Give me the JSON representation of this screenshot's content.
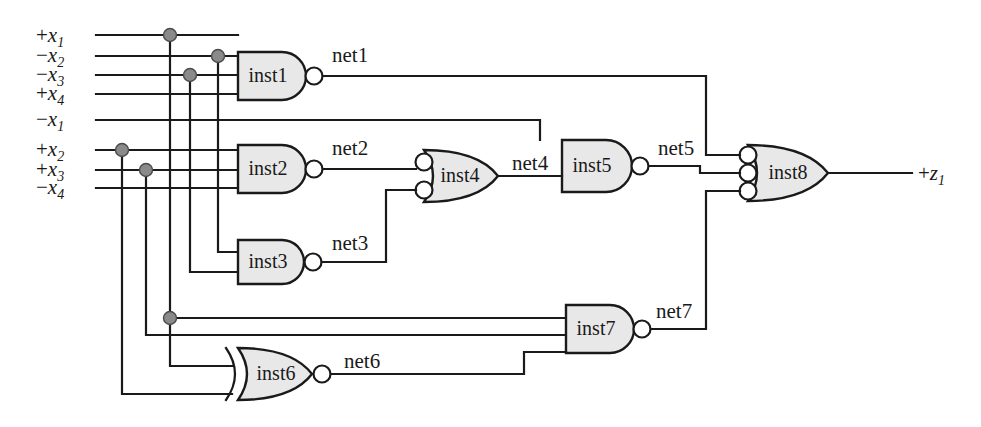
{
  "diagram": {
    "output_label": {
      "sign": "+",
      "var": "z",
      "sub": "1"
    },
    "colors": {
      "wire": "#1a1a1a",
      "gate_fill": "#e8e8e8",
      "gate_stroke": "#1a1a1a",
      "junction": "#8a8a8a",
      "bubble_fill": "#ffffff",
      "background": "#ffffff"
    }
  },
  "inputs": [
    {
      "id": "in1",
      "sign": "+",
      "var": "x",
      "sub": "1",
      "y": 35
    },
    {
      "id": "in2",
      "sign": "−",
      "var": "x",
      "sub": "2",
      "y": 56
    },
    {
      "id": "in3",
      "sign": "−",
      "var": "x",
      "sub": "3",
      "y": 75
    },
    {
      "id": "in4",
      "sign": "+",
      "var": "x",
      "sub": "4",
      "y": 94
    },
    {
      "id": "in5",
      "sign": "−",
      "var": "x",
      "sub": "1",
      "y": 120
    },
    {
      "id": "in6",
      "sign": "+",
      "var": "x",
      "sub": "2",
      "y": 150
    },
    {
      "id": "in7",
      "sign": "+",
      "var": "x",
      "sub": "3",
      "y": 170
    },
    {
      "id": "in8",
      "sign": "−",
      "var": "x",
      "sub": "4",
      "y": 188
    }
  ],
  "gates": [
    {
      "id": "inst1",
      "label": "inst1",
      "type": "nand",
      "inputs": 4,
      "x": 238,
      "y": 52,
      "w": 68,
      "h": 48
    },
    {
      "id": "inst2",
      "label": "inst2",
      "type": "nand",
      "inputs": 3,
      "x": 238,
      "y": 145,
      "w": 68,
      "h": 48
    },
    {
      "id": "inst3",
      "label": "inst3",
      "type": "nand",
      "inputs": 2,
      "x": 238,
      "y": 240,
      "w": 68,
      "h": 44
    },
    {
      "id": "inst4",
      "label": "inst4",
      "type": "or-inverted-inputs",
      "inputs": 2,
      "x": 424,
      "y": 150,
      "w": 74,
      "h": 52
    },
    {
      "id": "inst5",
      "label": "inst5",
      "type": "nand",
      "inputs": 2,
      "x": 562,
      "y": 140,
      "w": 68,
      "h": 52
    },
    {
      "id": "inst6",
      "label": "inst6",
      "type": "xnor",
      "inputs": 2,
      "x": 232,
      "y": 348,
      "w": 78,
      "h": 52
    },
    {
      "id": "inst7",
      "label": "inst7",
      "type": "nand",
      "inputs": 3,
      "x": 566,
      "y": 305,
      "w": 68,
      "h": 48
    },
    {
      "id": "inst8",
      "label": "inst8",
      "type": "or-inverted-inputs",
      "inputs": 3,
      "x": 748,
      "y": 145,
      "w": 78,
      "h": 56
    }
  ],
  "nets": [
    {
      "id": "net1",
      "label": "net1",
      "x": 332,
      "y": 60,
      "from": "inst1",
      "to": "inst8"
    },
    {
      "id": "net2",
      "label": "net2",
      "x": 332,
      "y": 152,
      "from": "inst2",
      "to": "inst4"
    },
    {
      "id": "net3",
      "label": "net3",
      "x": 332,
      "y": 248,
      "from": "inst3",
      "to": "inst4"
    },
    {
      "id": "net4",
      "label": "net4",
      "x": 512,
      "y": 168,
      "from": "inst4",
      "to": "inst5"
    },
    {
      "id": "net5",
      "label": "net5",
      "x": 658,
      "y": 152,
      "from": "inst5",
      "to": "inst8"
    },
    {
      "id": "net6",
      "label": "net6",
      "x": 344,
      "y": 366,
      "from": "inst6",
      "to": "inst7"
    },
    {
      "id": "net7",
      "label": "net7",
      "x": 656,
      "y": 315,
      "from": "inst7",
      "to": "inst8"
    }
  ],
  "junctions": [
    {
      "x": 170,
      "y": 35
    },
    {
      "x": 218,
      "y": 56
    },
    {
      "x": 190,
      "y": 75
    },
    {
      "x": 122,
      "y": 150
    },
    {
      "x": 146,
      "y": 170
    },
    {
      "x": 170,
      "y": 318
    }
  ]
}
